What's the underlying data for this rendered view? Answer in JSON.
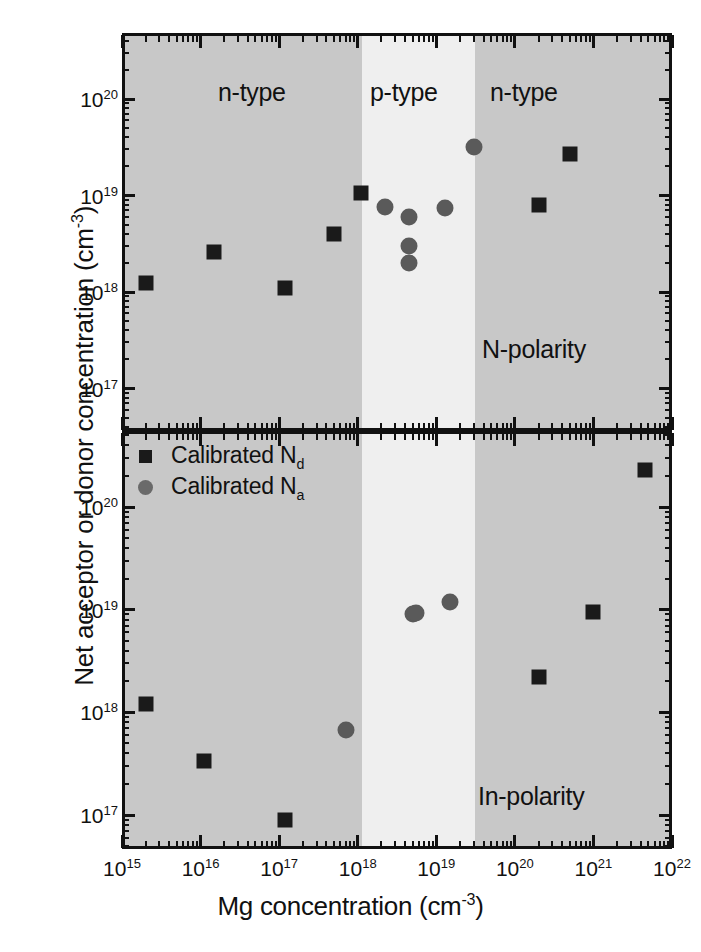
{
  "figure": {
    "xlabel_main": "Mg concentration (cm",
    "xlabel_exp": "-3",
    "xlabel_close": ")",
    "ylabel_main": "Net acceptor or donor concentration (cm",
    "ylabel_exp": "-3",
    "ylabel_close": ")"
  },
  "legend": {
    "items": [
      {
        "label_main": "Calibrated N",
        "label_sub": "d",
        "marker": "square",
        "color": "#1a1a1a"
      },
      {
        "label_main": "Calibrated N",
        "label_sub": "a",
        "marker": "circle",
        "color": "#6a6a6a"
      }
    ]
  },
  "colors": {
    "n_type_band": "#c8c8c8",
    "p_type_band": "#efefef",
    "frame": "#111111",
    "square_marker": "#1a1a1a",
    "circle_marker": "#5a5a5a",
    "background": "#ffffff"
  },
  "chart_data": [
    {
      "type": "scatter",
      "panel": "top",
      "panel_tag": "N-polarity",
      "title": "",
      "xlabel": "Mg concentration (cm^-3)",
      "ylabel": "Net acceptor or donor concentration (cm^-3)",
      "xscale": "log",
      "yscale": "log",
      "xlim": [
        1000000000000000.0,
        1e+22
      ],
      "ylim": [
        3.2e+16,
        3.2e+20
      ],
      "xticks": [
        "10^15",
        "10^16",
        "10^17",
        "10^18",
        "10^19",
        "10^20",
        "10^21",
        "10^22"
      ],
      "yticks": [
        "10^17",
        "10^18",
        "10^19",
        "10^20"
      ],
      "grid": false,
      "legend_position": "none",
      "region_bands": [
        {
          "label": "n-type",
          "xmin": 1000000000000000.0,
          "xmax": 1.12e+18,
          "fill": "#c8c8c8"
        },
        {
          "label": "p-type",
          "xmin": 1.12e+18,
          "xmax": 3.1e+19,
          "fill": "#efefef"
        },
        {
          "label": "n-type",
          "xmin": 3.1e+19,
          "xmax": 1e+22,
          "fill": "#c8c8c8"
        }
      ],
      "series": [
        {
          "name": "Calibrated N_d",
          "marker": "square",
          "color": "#1a1a1a",
          "x": [
            2000000000000000.0,
            1.5e+16,
            1.2e+17,
            5e+17,
            1.1e+18,
            2e+20,
            5e+20
          ],
          "y": [
            1.25e+18,
            2.6e+18,
            1.1e+18,
            4e+18,
            1.05e+19,
            8e+18,
            2.7e+19
          ]
        },
        {
          "name": "Calibrated N_a",
          "marker": "circle",
          "color": "#5a5a5a",
          "x": [
            2.2e+18,
            4.5e+18,
            4.5e+18,
            4.5e+18,
            1.3e+19,
            3e+19
          ],
          "y": [
            7.6e+18,
            6e+18,
            3e+18,
            2e+18,
            7.4e+18,
            3.2e+19
          ]
        }
      ]
    },
    {
      "type": "scatter",
      "panel": "bottom",
      "panel_tag": "In-polarity",
      "title": "",
      "xlabel": "Mg concentration (cm^-3)",
      "ylabel": "Net acceptor or donor concentration (cm^-3)",
      "xscale": "log",
      "yscale": "log",
      "xlim": [
        1000000000000000.0,
        1e+22
      ],
      "ylim": [
        4e+16,
        6e+20
      ],
      "xticks": [
        "10^15",
        "10^16",
        "10^17",
        "10^18",
        "10^19",
        "10^20",
        "10^21",
        "10^22"
      ],
      "yticks": [
        "10^17",
        "10^18",
        "10^19",
        "10^20"
      ],
      "grid": false,
      "legend_position": "upper-left",
      "region_bands": [
        {
          "label": "",
          "xmin": 1000000000000000.0,
          "xmax": 1.12e+18,
          "fill": "#c8c8c8"
        },
        {
          "label": "",
          "xmin": 1.12e+18,
          "xmax": 3.1e+19,
          "fill": "#efefef"
        },
        {
          "label": "",
          "xmin": 3.1e+19,
          "xmax": 1e+22,
          "fill": "#c8c8c8"
        }
      ],
      "series": [
        {
          "name": "Calibrated N_d",
          "marker": "square",
          "color": "#1a1a1a",
          "x": [
            2000000000000000.0,
            1.1e+16,
            1.2e+17,
            2e+20,
            1e+21,
            4.5e+21
          ],
          "y": [
            1.2e+18,
            3.4e+17,
            9e+16,
            2.2e+18,
            9.5e+18,
            2.3e+20
          ]
        },
        {
          "name": "Calibrated N_a",
          "marker": "circle",
          "color": "#5a5a5a",
          "x": [
            7e+17,
            5e+18,
            5.5e+18,
            1.5e+19
          ],
          "y": [
            6.8e+17,
            9e+18,
            9.3e+18,
            1.2e+19
          ]
        }
      ]
    }
  ],
  "region_labels": {
    "top_left": "n-type",
    "top_mid": "p-type",
    "top_right": "n-type"
  },
  "panel_tags": {
    "top": "N-polarity",
    "bottom": "In-polarity"
  },
  "tick_labels": {
    "x": [
      {
        "base": "10",
        "exp": "15"
      },
      {
        "base": "10",
        "exp": "16"
      },
      {
        "base": "10",
        "exp": "17"
      },
      {
        "base": "10",
        "exp": "18"
      },
      {
        "base": "10",
        "exp": "19"
      },
      {
        "base": "10",
        "exp": "20"
      },
      {
        "base": "10",
        "exp": "21"
      },
      {
        "base": "10",
        "exp": "22"
      }
    ],
    "y_top": [
      {
        "base": "10",
        "exp": "20"
      },
      {
        "base": "10",
        "exp": "19"
      },
      {
        "base": "10",
        "exp": "18"
      },
      {
        "base": "10",
        "exp": "17"
      }
    ],
    "y_bottom": [
      {
        "base": "10",
        "exp": "20"
      },
      {
        "base": "10",
        "exp": "19"
      },
      {
        "base": "10",
        "exp": "18"
      },
      {
        "base": "10",
        "exp": "17"
      }
    ]
  }
}
